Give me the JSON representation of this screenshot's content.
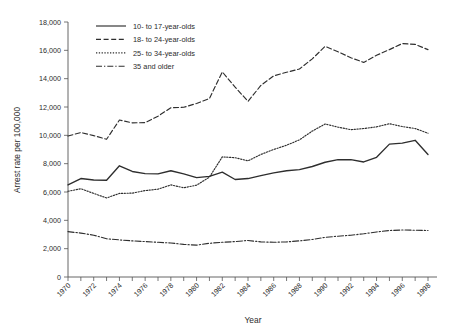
{
  "chart_data": {
    "type": "line",
    "title": "",
    "xlabel": "Year",
    "ylabel": "Arrest rate per 100,000",
    "xlim": [
      1970,
      1998
    ],
    "ylim": [
      0,
      18000
    ],
    "ytick_values": [
      0,
      2000,
      4000,
      6000,
      8000,
      10000,
      12000,
      14000,
      16000,
      18000
    ],
    "ytick_labels": [
      "0",
      "2,000",
      "4,000",
      "6,000",
      "8,000",
      "10,000",
      "12,000",
      "14,000",
      "16,000",
      "18,000"
    ],
    "x": [
      1970,
      1971,
      1972,
      1973,
      1974,
      1975,
      1976,
      1977,
      1978,
      1979,
      1980,
      1981,
      1982,
      1983,
      1984,
      1985,
      1986,
      1987,
      1988,
      1989,
      1990,
      1991,
      1992,
      1993,
      1994,
      1995,
      1996,
      1997,
      1998
    ],
    "xtick_labels": [
      "1970",
      "1972",
      "1974",
      "1976",
      "1978",
      "1980",
      "1982",
      "1984",
      "1986",
      "1988",
      "1990",
      "1992",
      "1994",
      "1996",
      "1998"
    ],
    "xtick_values": [
      1970,
      1972,
      1974,
      1976,
      1978,
      1980,
      1982,
      1984,
      1986,
      1988,
      1990,
      1992,
      1994,
      1996,
      1998
    ],
    "grid": false,
    "legend_position": "top-left",
    "series": [
      {
        "name": "10- to 17-year-olds",
        "style": "solid",
        "values": [
          6500,
          6950,
          6850,
          6830,
          7850,
          7450,
          7300,
          7280,
          7500,
          7280,
          7020,
          7100,
          7400,
          6880,
          6950,
          7150,
          7350,
          7500,
          7580,
          7800,
          8100,
          8280,
          8280,
          8120,
          8450,
          9380,
          9450,
          9650,
          8650
        ]
      },
      {
        "name": "18- to 24-year-olds",
        "style": "dashed",
        "values": [
          9950,
          10200,
          9980,
          9720,
          11080,
          10880,
          10900,
          11350,
          11950,
          11980,
          12250,
          12600,
          14480,
          13400,
          12400,
          13520,
          14200,
          14450,
          14680,
          15400,
          16280,
          15900,
          15480,
          15150,
          15650,
          16050,
          16480,
          16420,
          16050
        ]
      },
      {
        "name": "25- to 34-year-olds",
        "style": "dotted",
        "values": [
          6050,
          6230,
          5900,
          5580,
          5900,
          5920,
          6100,
          6200,
          6500,
          6300,
          6480,
          7050,
          8480,
          8420,
          8200,
          8650,
          9000,
          9300,
          9680,
          10300,
          10800,
          10580,
          10400,
          10480,
          10600,
          10820,
          10620,
          10480,
          10150
        ]
      },
      {
        "name": "35 and older",
        "style": "dash-dot",
        "values": [
          3200,
          3100,
          2950,
          2700,
          2620,
          2550,
          2500,
          2450,
          2400,
          2300,
          2250,
          2380,
          2450,
          2500,
          2580,
          2480,
          2450,
          2480,
          2550,
          2650,
          2800,
          2880,
          2950,
          3050,
          3180,
          3280,
          3320,
          3300,
          3280
        ]
      }
    ]
  },
  "legend": {
    "items": [
      {
        "label": "10- to 17-year-olds",
        "style": "solid"
      },
      {
        "label": "18- to 24-year-olds",
        "style": "dashed"
      },
      {
        "label": "25- to 34-year-olds",
        "style": "dotted"
      },
      {
        "label": "35 and older",
        "style": "dash-dot"
      }
    ]
  },
  "colors": {
    "line": "#2e2e2e",
    "axis": "#555555",
    "text": "#2b2b2b",
    "background": "#ffffff"
  }
}
